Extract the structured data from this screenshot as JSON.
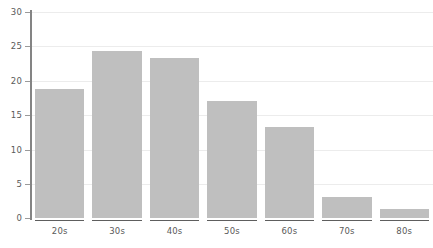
{
  "chart_data": {
    "type": "bar",
    "title": "",
    "subtitle": "",
    "xlabel": "",
    "ylabel": "",
    "categories": [
      "20s",
      "30s",
      "40s",
      "50s",
      "60s",
      "70s",
      "80s"
    ],
    "values": [
      18.8,
      24.3,
      23.3,
      17.1,
      13.3,
      3.1,
      1.3
    ],
    "series": [
      {
        "name": "",
        "values": [
          18.8,
          24.3,
          23.3,
          17.1,
          13.3,
          3.1,
          1.3
        ]
      }
    ],
    "ylim": [
      0,
      30
    ],
    "xlim": [
      0,
      7
    ],
    "y_ticks": [
      0,
      5,
      10,
      15,
      20,
      25,
      30
    ],
    "y_tick_labels": [
      "0",
      "5",
      "10",
      "15",
      "20",
      "25",
      "30"
    ],
    "x_tick_labels": [
      "20s",
      "30s",
      "40s",
      "50s",
      "60s",
      "70s",
      "80s"
    ],
    "grid": true,
    "grid_axis": "y",
    "legend": false,
    "legend_position": "none",
    "annotations": [],
    "colors": {
      "bar_fill": "#bfbfbf",
      "gridline": "#ececec",
      "axis_line": "#848484",
      "baseline": "#5e5e5e",
      "tick_text": "#5a5a5a",
      "background": "#ffffff"
    }
  }
}
